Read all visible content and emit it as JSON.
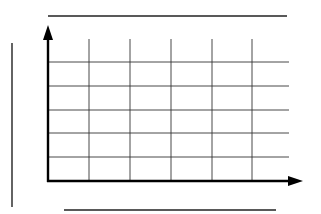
{
  "chart_data": {
    "type": "line",
    "title": "",
    "xlabel": "",
    "ylabel": "",
    "categories": [],
    "series": [],
    "grid": true,
    "legend": null,
    "note": "Blank chart template: axes with arrowheads, 5x6 grid, placeholder lines for title, x-axis label and y-axis label; no data plotted"
  },
  "colors": {
    "axis": "#000000",
    "grid": "#333333",
    "placeholder": "#222222",
    "background": "#ffffff"
  },
  "layout": {
    "title_line": {
      "x1": 48,
      "x2": 287,
      "y": 16
    },
    "ylabel_line": {
      "x": 12,
      "y1": 43,
      "y2": 209
    },
    "xlabel_line": {
      "x1": 64,
      "x2": 276,
      "y": 210
    },
    "origin": {
      "x": 48,
      "y": 181
    },
    "x_axis_end": 303,
    "y_axis_end": 25,
    "v_grid_x": [
      89,
      130,
      171,
      212,
      252
    ],
    "h_grid_y": [
      62,
      86,
      110,
      133,
      157
    ],
    "grid_top": 39,
    "grid_right": 289
  }
}
